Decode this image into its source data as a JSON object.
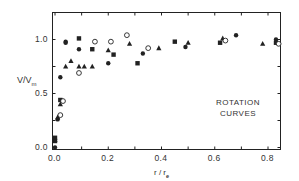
{
  "chart_data": {
    "type": "scatter",
    "title": "",
    "annotation": [
      "ROTATION",
      "CURVES"
    ],
    "xlabel": "r / r_e",
    "xlabel_main": "r / r",
    "xlabel_sub": "e",
    "ylabel_main": "V/V",
    "ylabel_sub": "m",
    "xlim": [
      0.0,
      0.85
    ],
    "ylim": [
      0.0,
      1.1
    ],
    "x_ticks": [
      0.0,
      0.1,
      0.2,
      0.3,
      0.4,
      0.5,
      0.6,
      0.7,
      0.8
    ],
    "x_tick_labels": [
      "0.0",
      "",
      "0.2",
      "",
      "0.4",
      "",
      "0.6",
      "",
      "0.8"
    ],
    "y_ticks": [
      0.0,
      0.25,
      0.5,
      0.75,
      1.0
    ],
    "y_tick_labels": [
      "0.0",
      "",
      "0.5",
      "",
      "1.0"
    ],
    "grid": false,
    "legend": null,
    "series": [
      {
        "name": "filled-circles",
        "marker": "circle-filled",
        "points": [
          [
            0.0,
            0.0
          ],
          [
            0.01,
            0.26
          ],
          [
            0.02,
            0.65
          ],
          [
            0.04,
            0.97
          ],
          [
            0.04,
            0.98
          ],
          [
            0.09,
            0.91
          ],
          [
            0.2,
            0.78
          ],
          [
            0.33,
            0.87
          ],
          [
            0.49,
            0.93
          ],
          [
            0.68,
            1.04
          ],
          [
            0.83,
            1.0
          ]
        ]
      },
      {
        "name": "filled-squares",
        "marker": "square-filled",
        "points": [
          [
            0.0,
            0.06
          ],
          [
            0.0,
            0.09
          ],
          [
            0.02,
            0.44
          ],
          [
            0.09,
            1.01
          ],
          [
            0.14,
            0.91
          ],
          [
            0.22,
            0.86
          ],
          [
            0.31,
            0.78
          ],
          [
            0.45,
            0.98
          ],
          [
            0.62,
            0.97
          ],
          [
            0.83,
            0.97
          ]
        ]
      },
      {
        "name": "filled-triangles",
        "marker": "triangle-filled",
        "points": [
          [
            0.0,
            0.07
          ],
          [
            0.01,
            0.28
          ],
          [
            0.02,
            0.4
          ],
          [
            0.04,
            0.75
          ],
          [
            0.06,
            0.8
          ],
          [
            0.09,
            0.75
          ],
          [
            0.11,
            0.75
          ],
          [
            0.14,
            0.75
          ],
          [
            0.2,
            0.9
          ],
          [
            0.28,
            0.96
          ],
          [
            0.39,
            0.92
          ],
          [
            0.5,
            0.97
          ],
          [
            0.63,
            1.01
          ],
          [
            0.78,
            0.96
          ]
        ]
      },
      {
        "name": "open-circles",
        "marker": "circle-open",
        "points": [
          [
            0.02,
            0.3
          ],
          [
            0.03,
            0.43
          ],
          [
            0.09,
            0.69
          ],
          [
            0.15,
            0.98
          ],
          [
            0.21,
            0.98
          ],
          [
            0.27,
            1.04
          ],
          [
            0.35,
            0.92
          ],
          [
            0.64,
            0.99
          ],
          [
            0.84,
            0.96
          ]
        ]
      }
    ]
  },
  "colors": {
    "ink": "#222222",
    "background": "#ffffff"
  }
}
